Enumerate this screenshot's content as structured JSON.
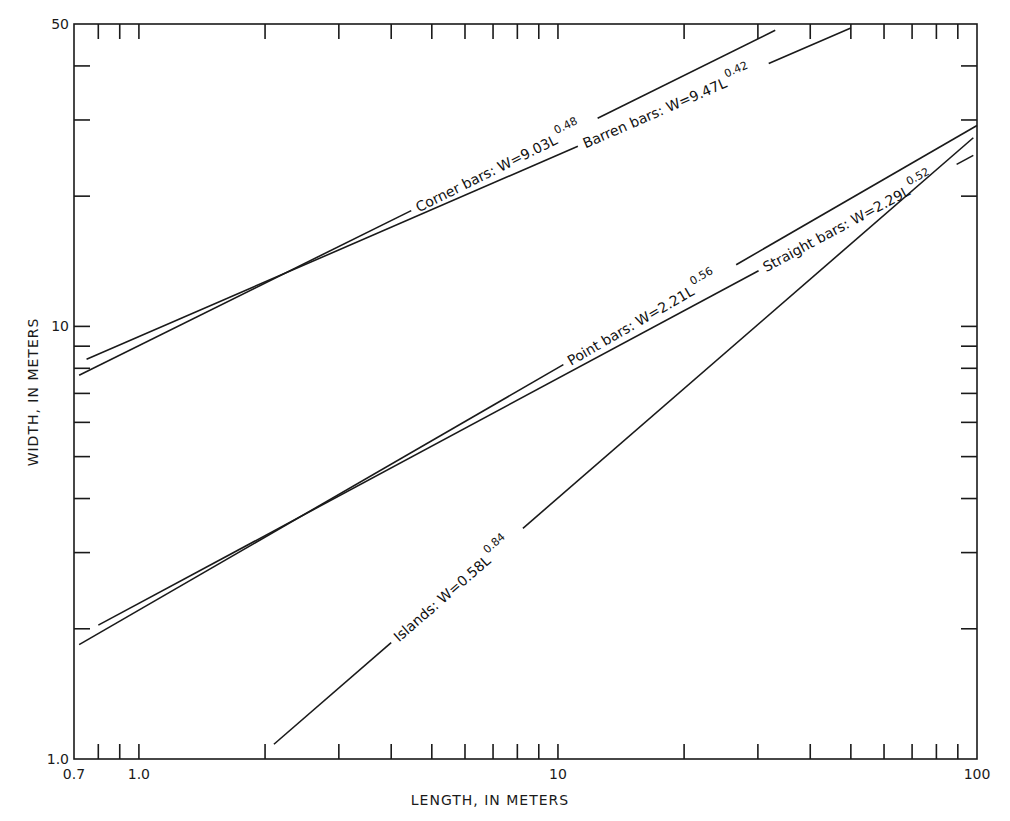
{
  "chart_data": {
    "type": "line",
    "title": "",
    "xlabel": "LENGTH, IN METERS",
    "ylabel": "WIDTH, IN METERS",
    "xscale": "log",
    "yscale": "log",
    "xlim": [
      0.7,
      100
    ],
    "ylim": [
      1.0,
      50
    ],
    "grid": false,
    "legend": "inline labels along curves",
    "x_tick_labels": [
      {
        "value": 0.7,
        "label": "0.7"
      },
      {
        "value": 1.0,
        "label": "1.0"
      },
      {
        "value": 10,
        "label": "10"
      },
      {
        "value": 100,
        "label": "100"
      }
    ],
    "y_tick_labels": [
      {
        "value": 1.0,
        "label": "1.0"
      },
      {
        "value": 10,
        "label": "10"
      },
      {
        "value": 50,
        "label": "50"
      }
    ],
    "x_minor_ticks": [
      0.8,
      0.9,
      1,
      2,
      3,
      4,
      5,
      6,
      7,
      8,
      9,
      10,
      20,
      30,
      40,
      50,
      60,
      70,
      80,
      90
    ],
    "y_minor_ticks": [
      2,
      3,
      4,
      5,
      6,
      7,
      8,
      9,
      10,
      20,
      30,
      40
    ],
    "series": [
      {
        "name": "Corner bars",
        "equation": "W = 9.03L^0.48",
        "coef": 9.03,
        "exp": 0.48,
        "x_range": [
          0.72,
          33
        ],
        "label_main": "Corner bars: W=9.03L",
        "label_exp": "0.48",
        "label_at": 4.6
      },
      {
        "name": "Barren bars",
        "equation": "W = 9.47L^0.42",
        "coef": 9.47,
        "exp": 0.42,
        "x_range": [
          0.75,
          50
        ],
        "label_main": "Barren bars: W=9.47L",
        "label_exp": "0.42",
        "label_at": 11.5
      },
      {
        "name": "Point bars",
        "equation": "W = 2.21L^0.56",
        "coef": 2.21,
        "exp": 0.56,
        "x_range": [
          0.72,
          100
        ],
        "label_main": "Point bars: W=2.21L",
        "label_exp": "0.56",
        "label_at": 10.6
      },
      {
        "name": "Straight bars",
        "equation": "W = 2.29L^0.52",
        "coef": 2.29,
        "exp": 0.52,
        "x_range": [
          0.8,
          98
        ],
        "label_main": "Straight bars: W=2.29L",
        "label_exp": "0.52",
        "label_at": 31
      },
      {
        "name": "Islands",
        "equation": "W = 0.58L^0.84",
        "coef": 0.58,
        "exp": 0.84,
        "x_range": [
          2.1,
          98
        ],
        "label_main": "Islands: W=0.58L",
        "label_exp": "0.84",
        "label_at": 4.1
      }
    ]
  }
}
